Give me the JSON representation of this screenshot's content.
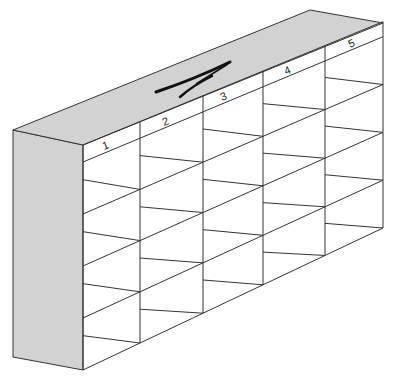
{
  "diagram": {
    "title": "",
    "top_marking": "A",
    "column_labels": [
      "1",
      "2",
      "3",
      "4",
      "5"
    ],
    "columns": 5,
    "rows": 4,
    "colors": {
      "shade": "#d2d2d2",
      "line": "#333333",
      "background": "#ffffff"
    }
  }
}
